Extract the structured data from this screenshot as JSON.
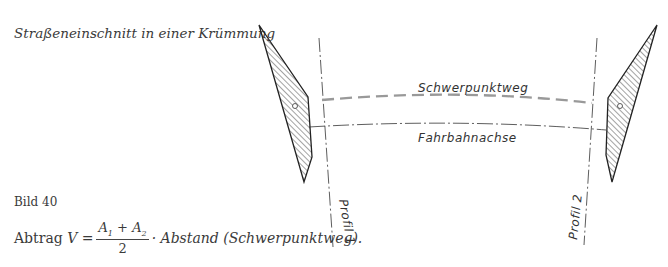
{
  "caption": {
    "title": "Straßeneinschnitt in einer Krümmung",
    "figure_label": "Bild 40"
  },
  "formula": {
    "lhs": "Abtrag",
    "variable": "V",
    "equals": "=",
    "numerator_a1": "A",
    "sub1": "1",
    "plus": "+",
    "numerator_a2": "A",
    "sub2": "2",
    "denominator": "2",
    "rhs": "· Abstand (Schwerpunktweg)."
  },
  "diagram": {
    "labels": {
      "centroid_path": "Schwerpunktweg",
      "road_axis": "Fahrbahnachse",
      "profile_1": "Profil  1",
      "profile_2": "Profil  2"
    },
    "colors": {
      "line": "#333333",
      "centroid_dash": "#999999"
    }
  }
}
